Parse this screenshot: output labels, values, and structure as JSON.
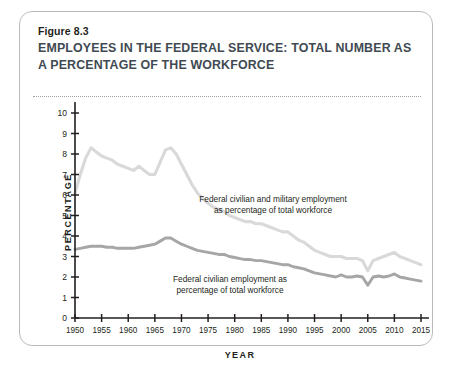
{
  "figure": {
    "number_label": "Figure 8.3",
    "title": "EMPLOYEES IN THE FEDERAL SERVICE: TOTAL NUMBER AS A PERCENTAGE OF THE WORKFORCE"
  },
  "colors": {
    "series_light": "#d9d9d9",
    "series_dark": "#a6a6a6",
    "axis": "#231f20",
    "card_border": "#b9bcbe",
    "title_text": "#3f4a52"
  },
  "chart_data": {
    "type": "line",
    "title": "EMPLOYEES IN THE FEDERAL SERVICE: TOTAL NUMBER AS A PERCENTAGE OF THE WORKFORCE",
    "xlabel": "YEAR",
    "ylabel": "PERCENTAGE",
    "xlim": [
      1950,
      2015
    ],
    "ylim": [
      0,
      10
    ],
    "xticks": [
      1950,
      1955,
      1960,
      1965,
      1970,
      1975,
      1980,
      1985,
      1990,
      1995,
      2000,
      2005,
      2010,
      2015
    ],
    "yticks": [
      0,
      1,
      2,
      3,
      4,
      5,
      6,
      7,
      8,
      9,
      10
    ],
    "grid": false,
    "legend": "inline-annotations",
    "series": [
      {
        "name": "Federal civilian and military employment as percentage of total workforce",
        "color": "#d9d9d9",
        "annotation": "Federal civilian and military employment\nas percentage of total workforce",
        "x": [
          1950,
          1951,
          1952,
          1953,
          1954,
          1955,
          1956,
          1957,
          1958,
          1959,
          1960,
          1961,
          1962,
          1963,
          1964,
          1965,
          1966,
          1967,
          1968,
          1969,
          1970,
          1971,
          1972,
          1973,
          1974,
          1975,
          1976,
          1977,
          1978,
          1979,
          1980,
          1981,
          1982,
          1983,
          1984,
          1985,
          1986,
          1987,
          1988,
          1989,
          1990,
          1991,
          1992,
          1993,
          1994,
          1995,
          1996,
          1997,
          1998,
          1999,
          2000,
          2001,
          2002,
          2003,
          2004,
          2005,
          2006,
          2007,
          2008,
          2009,
          2010,
          2011,
          2012,
          2013,
          2014,
          2015
        ],
        "y": [
          6.1,
          7.0,
          7.8,
          8.3,
          8.1,
          7.9,
          7.8,
          7.7,
          7.5,
          7.4,
          7.3,
          7.2,
          7.4,
          7.2,
          7.0,
          7.0,
          7.6,
          8.2,
          8.3,
          8.0,
          7.5,
          7.0,
          6.5,
          6.1,
          5.8,
          5.6,
          5.4,
          5.3,
          5.2,
          5.0,
          4.9,
          4.8,
          4.7,
          4.7,
          4.6,
          4.6,
          4.5,
          4.4,
          4.3,
          4.2,
          4.2,
          4.0,
          3.8,
          3.7,
          3.5,
          3.3,
          3.2,
          3.1,
          3.0,
          3.0,
          3.0,
          2.9,
          2.9,
          2.9,
          2.8,
          2.3,
          2.8,
          2.9,
          3.0,
          3.1,
          3.2,
          3.0,
          2.9,
          2.8,
          2.7,
          2.6
        ]
      },
      {
        "name": "Federal civilian employment as percentage of total workforce",
        "color": "#a6a6a6",
        "annotation": "Federal civilian employment as\npercentage of total workforce",
        "x": [
          1950,
          1951,
          1952,
          1953,
          1954,
          1955,
          1956,
          1957,
          1958,
          1959,
          1960,
          1961,
          1962,
          1963,
          1964,
          1965,
          1966,
          1967,
          1968,
          1969,
          1970,
          1971,
          1972,
          1973,
          1974,
          1975,
          1976,
          1977,
          1978,
          1979,
          1980,
          1981,
          1982,
          1983,
          1984,
          1985,
          1986,
          1987,
          1988,
          1989,
          1990,
          1991,
          1992,
          1993,
          1994,
          1995,
          1996,
          1997,
          1998,
          1999,
          2000,
          2001,
          2002,
          2003,
          2004,
          2005,
          2006,
          2007,
          2008,
          2009,
          2010,
          2011,
          2012,
          2013,
          2014,
          2015
        ],
        "y": [
          3.35,
          3.4,
          3.45,
          3.5,
          3.5,
          3.5,
          3.45,
          3.45,
          3.4,
          3.4,
          3.4,
          3.4,
          3.45,
          3.5,
          3.55,
          3.6,
          3.75,
          3.9,
          3.9,
          3.75,
          3.6,
          3.5,
          3.4,
          3.3,
          3.25,
          3.2,
          3.15,
          3.1,
          3.1,
          3.0,
          2.95,
          2.9,
          2.85,
          2.85,
          2.8,
          2.8,
          2.75,
          2.7,
          2.65,
          2.6,
          2.6,
          2.5,
          2.45,
          2.4,
          2.3,
          2.2,
          2.15,
          2.1,
          2.05,
          2.0,
          2.1,
          2.0,
          2.0,
          2.05,
          2.0,
          1.6,
          2.0,
          2.05,
          2.0,
          2.05,
          2.15,
          2.0,
          1.95,
          1.9,
          1.85,
          1.8
        ]
      }
    ]
  },
  "axes": {
    "y_label": "PERCENTAGE",
    "x_label": "YEAR",
    "y_tick_labels": [
      "0",
      "1",
      "2",
      "3",
      "4",
      "5",
      "6",
      "7",
      "8",
      "9",
      "10"
    ],
    "x_tick_labels": [
      "1950",
      "1955",
      "1960",
      "1965",
      "1970",
      "1975",
      "1980",
      "1985",
      "1990",
      "1995",
      "2000",
      "2005",
      "2010",
      "2015"
    ]
  }
}
